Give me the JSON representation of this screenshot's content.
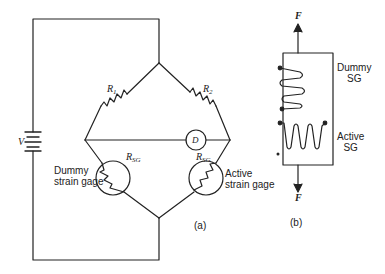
{
  "figure": {
    "panel_a": {
      "label": "(a)",
      "source_label": "V",
      "detector_label": "D",
      "r1_label": "R",
      "r1_sub": "1",
      "r2_label": "R",
      "r2_sub": "2",
      "rsg_left_label": "R",
      "rsg_left_sub": "SG",
      "rsg_right_label": "R",
      "rsg_right_sub": "SG",
      "dummy_label_line1": "Dummy",
      "dummy_label_line2": "strain gage",
      "active_label_line1": "Active",
      "active_label_line2": "strain gage"
    },
    "panel_b": {
      "label": "(b)",
      "force_top": "F",
      "force_bottom": "F",
      "dummy_line1": "Dummy",
      "dummy_line2": "SG",
      "active_line1": "Active",
      "active_line2": "SG"
    },
    "colors": {
      "ink": "#222222",
      "background": "#ffffff"
    }
  }
}
